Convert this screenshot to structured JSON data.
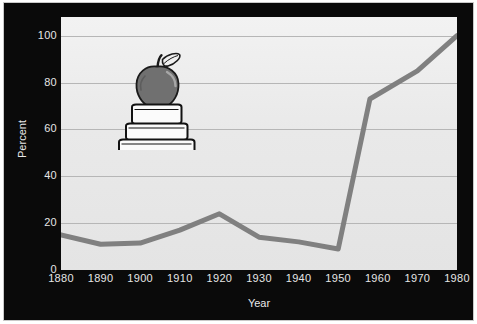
{
  "chart_data": {
    "type": "line",
    "title": "",
    "xlabel": "Year",
    "ylabel": "Percent",
    "x": [
      1880,
      1890,
      1900,
      1910,
      1920,
      1930,
      1940,
      1950,
      1958,
      1970,
      1980
    ],
    "values": [
      15,
      11,
      11.5,
      17,
      24,
      14,
      12,
      9,
      73,
      85,
      100
    ],
    "series": [
      {
        "name": "Percent",
        "x": [
          1880,
          1890,
          1900,
          1910,
          1920,
          1930,
          1940,
          1950,
          1958,
          1970,
          1980
        ],
        "values": [
          15,
          11,
          11.5,
          17,
          24,
          14,
          12,
          9,
          73,
          85,
          100
        ]
      }
    ],
    "xlim": [
      1880,
      1980
    ],
    "ylim": [
      0,
      108
    ],
    "xticks": [
      1880,
      1890,
      1900,
      1910,
      1920,
      1930,
      1940,
      1950,
      1960,
      1970,
      1980
    ],
    "xtick_labels": [
      "1880",
      "1890",
      "1900",
      "1910",
      "1920",
      "1930",
      "1940",
      "1950",
      "1960",
      "1970",
      "1980"
    ],
    "yticks": [
      0,
      20,
      40,
      60,
      80,
      100
    ],
    "ytick_labels": [
      "0",
      "20",
      "40",
      "60",
      "80",
      "100"
    ],
    "grid": "horizontal",
    "legend": "none",
    "line_color": "#808080",
    "plot_background": "#ececec",
    "figure_background": "#0a0a0a",
    "tick_label_color": "#e6e6e6",
    "gridline_color": "#b6b6b6"
  },
  "axes": {
    "x_title": "Year",
    "y_title": "Percent"
  },
  "artwork": {
    "name": "apple-on-books",
    "apple_color": "#707070",
    "apple_outline": "#1a1a1a",
    "book_color": "#fbfbfb",
    "book_outline": "#121212"
  }
}
